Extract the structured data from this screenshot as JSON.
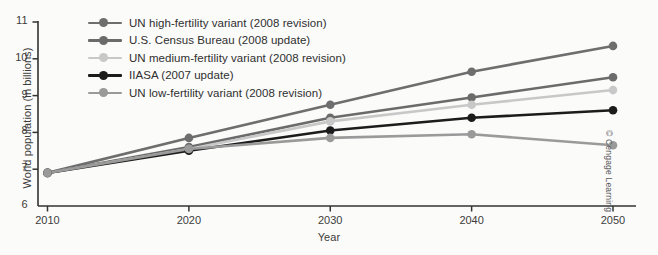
{
  "chart_data": {
    "type": "line",
    "title": "",
    "xlabel": "Year",
    "ylabel": "World population (in billions)",
    "x": [
      2010,
      2020,
      2030,
      2040,
      2050
    ],
    "xtick_labels": [
      "2010",
      "2020",
      "2030",
      "2040",
      "2050"
    ],
    "ytick_labels": [
      "6",
      "7",
      "8",
      "9",
      "10",
      "11"
    ],
    "yticks": [
      6,
      7,
      8,
      9,
      10,
      11
    ],
    "xlim": [
      2008,
      2052
    ],
    "ylim": [
      6,
      11
    ],
    "grid": false,
    "legend_position": "upper-left-inside",
    "series": [
      {
        "name": "UN high-fertility variant (2008 revision)",
        "color": "#6e6e6e",
        "values": [
          6.9,
          7.85,
          8.75,
          9.65,
          10.35
        ]
      },
      {
        "name": "U.S. Census Bureau (2008 update)",
        "color": "#6b6b6b",
        "values": [
          6.9,
          7.6,
          8.4,
          8.95,
          9.5
        ]
      },
      {
        "name": "UN medium-fertility variant (2008 revision)",
        "color": "#c8c8c8",
        "values": [
          6.9,
          7.55,
          8.3,
          8.75,
          9.15
        ]
      },
      {
        "name": "IIASA (2007 update)",
        "color": "#1c1c1c",
        "values": [
          6.9,
          7.5,
          8.05,
          8.4,
          8.6
        ]
      },
      {
        "name": "UN low-fertility variant (2008 revision)",
        "color": "#9a9a9a",
        "values": [
          6.9,
          7.55,
          7.85,
          7.95,
          7.65
        ]
      }
    ]
  },
  "credit": "© Cengage Learning",
  "axis_color": "#333333"
}
